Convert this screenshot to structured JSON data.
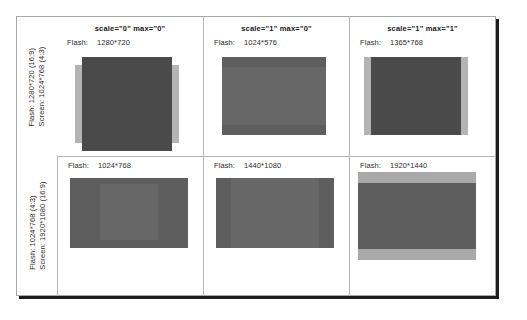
{
  "diagram": {
    "columns": [
      {
        "header": "scale=\"0\" max=\"0\""
      },
      {
        "header": "scale=\"1\" max=\"0\""
      },
      {
        "header": "scale=\"1\" max=\"1\""
      }
    ],
    "rows": [
      {
        "screen_label": "Screen: 1024*768  (4:3)",
        "flash_label": "Flash:   1280*720  (16:9)",
        "cells": [
          {
            "flash_key": "Flash:",
            "flash_value": "1280*720"
          },
          {
            "flash_key": "Flash:",
            "flash_value": "1024*576"
          },
          {
            "flash_key": "Flash:",
            "flash_value": "1365*768"
          }
        ]
      },
      {
        "screen_label": "Screen: 1920*1080 (16:9)",
        "flash_label": "Flash:   1024*768  (4:3)",
        "cells": [
          {
            "flash_key": "Flash:",
            "flash_value": "1024*768"
          },
          {
            "flash_key": "Flash:",
            "flash_value": "1440*1080"
          },
          {
            "flash_key": "Flash:",
            "flash_value": "1920*1440"
          }
        ]
      }
    ],
    "colors": {
      "screen_light": "#b4b4b4",
      "screen_dark": "#5e5e5e",
      "flash_dark": "#4a4a4a",
      "flash_mid": "#676767",
      "flash_light": "#a9a9a9",
      "frame_border": "#a8a8a8",
      "frame_shadow": "#1c1c1c",
      "grid_line": "#b5b5b5"
    }
  }
}
